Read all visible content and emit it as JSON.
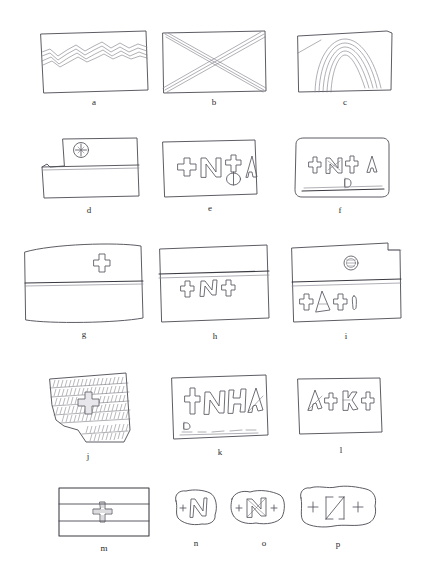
{
  "plate": {
    "title": "Brick and tile fragments with incised marks and inscriptions",
    "background_color": "#ffffff",
    "ink_color": "#4a4a52",
    "soft_ink_color": "#8d8d97",
    "width": 421,
    "height": 573
  },
  "figures": [
    {
      "id": "a",
      "caption": "a",
      "description": "Rectangular brick with double wavy combed band across upper part",
      "motif": "wavy-lines",
      "glyphs": []
    },
    {
      "id": "b",
      "caption": "b",
      "description": "Rectangular brick with large saltire cross from corner to corner",
      "motif": "saltire-cross",
      "glyphs": []
    },
    {
      "id": "c",
      "caption": "c",
      "description": "Rectangular brick with concentric finger-drawn arcs and diagonal stroke",
      "motif": "concentric-arcs",
      "glyphs": []
    },
    {
      "id": "d",
      "caption": "d",
      "description": "Brick with stepped notch on left edge, horizontal groove and circled cross stamp",
      "motif": "circled-cross-stamp",
      "glyphs": [
        "circled-cross"
      ]
    },
    {
      "id": "e",
      "caption": "e",
      "description": "Rectangular brick with relief inscription",
      "motif": "inscription",
      "glyphs": [
        "+",
        "N",
        "cross-on-circle",
        "A"
      ]
    },
    {
      "id": "f",
      "caption": "f",
      "description": "Rectangular brick with inscription and small mark below, groove near base",
      "motif": "inscription",
      "glyphs": [
        "+",
        "N",
        "+",
        "A",
        "small-mark"
      ]
    },
    {
      "id": "g",
      "caption": "g",
      "description": "Brick with horizontal groove and single small cross above it",
      "motif": "single-cross",
      "glyphs": [
        "+"
      ]
    },
    {
      "id": "h",
      "caption": "h",
      "description": "Brick with horizontal groove and inscription just below the groove",
      "motif": "inscription",
      "glyphs": [
        "+",
        "N",
        "+"
      ]
    },
    {
      "id": "i",
      "caption": "i",
      "description": "Brick with notched top right corner, circular stamp above groove and inscription below",
      "motif": "stamp-and-inscription",
      "glyphs": [
        "circular-stamp",
        "+",
        "A",
        "+",
        "I"
      ]
    },
    {
      "id": "j",
      "caption": "j",
      "description": "Irregular fragment with dense horizontal combed hatching and central Greek cross",
      "motif": "hatched-bands-with-cross",
      "glyphs": [
        "greek-cross"
      ]
    },
    {
      "id": "k",
      "caption": "k",
      "description": "Rectangular brick with ligatured relief inscription and small marks near base",
      "motif": "inscription",
      "glyphs": [
        "+",
        "N",
        "H",
        "A"
      ]
    },
    {
      "id": "l",
      "caption": "l",
      "description": "Rectangular brick with four incised glyph groups",
      "motif": "inscription",
      "glyphs": [
        "A",
        "+",
        "EA",
        "+"
      ]
    },
    {
      "id": "m",
      "caption": "m",
      "description": "Ruled rectangular brick with two horizontal lines and small hatched cross at centre",
      "motif": "banded-with-cross",
      "glyphs": [
        "hatched-cross"
      ]
    },
    {
      "id": "n",
      "caption": "n",
      "description": "Small irregular sherd with incised cross and letter",
      "motif": "inscription",
      "glyphs": [
        "+",
        "N"
      ]
    },
    {
      "id": "o",
      "caption": "o",
      "description": "Small irregular sherd with cross, ligature and cross",
      "motif": "inscription",
      "glyphs": [
        "+",
        "N",
        "+"
      ]
    },
    {
      "id": "p",
      "caption": "p",
      "description": "Irregular fragment with cross, angular ligature and cross",
      "motif": "inscription",
      "glyphs": [
        "+",
        "N",
        "+"
      ]
    }
  ]
}
